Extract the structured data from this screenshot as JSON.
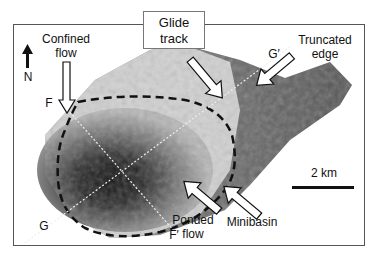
{
  "figure": {
    "labels": {
      "confined_flow": "Confined\nflow",
      "confined_line1": "Confined",
      "confined_line2": "flow",
      "glide_line1": "Glide",
      "glide_line2": "track",
      "truncated_line1": "Truncated",
      "truncated_line2": "edge",
      "ponded_line1": "Ponded",
      "ponded_line2": "flow",
      "minibasin": "Minibasin",
      "north": "N",
      "F": "F",
      "F_prime": "F′",
      "G": "G",
      "G_prime": "G′"
    },
    "scale_bar": {
      "label": "2 km"
    },
    "colors": {
      "frame": "#555555",
      "arrow_fill": "#ffffff",
      "arrow_stroke": "#111111",
      "dashed": "#111111"
    }
  }
}
